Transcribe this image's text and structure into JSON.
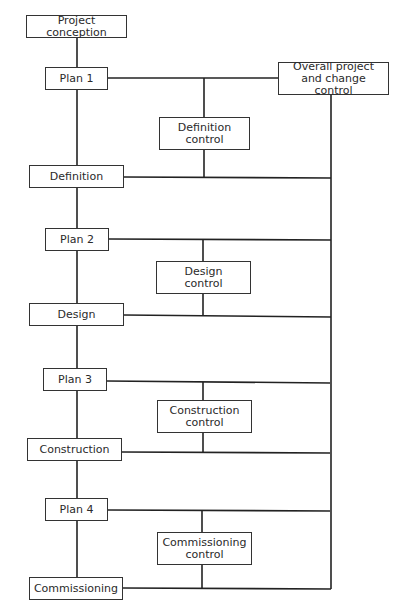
{
  "nodes": {
    "conception": "Project conception",
    "plan1": "Plan 1",
    "overall": "Overall project and change control",
    "def_control": "Definition control",
    "definition": "Definition",
    "plan2": "Plan 2",
    "design_control": "Design control",
    "design": "Design",
    "plan3": "Plan 3",
    "construction_control": "Construction control",
    "construction": "Construction",
    "plan4": "Plan 4",
    "commissioning_control": "Commissioning control",
    "commissioning": "Commissioning"
  },
  "colors": {
    "line": "#222222",
    "text": "#2a2a2a",
    "background": "#ffffff"
  }
}
